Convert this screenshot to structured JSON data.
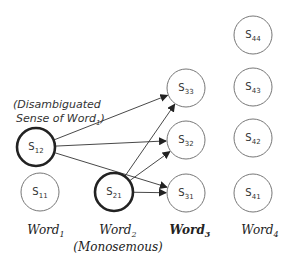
{
  "diagram": {
    "annotation": {
      "line1": "(Disambiguated",
      "line2_prefix": "Sense of Word",
      "line2_sub": "1",
      "line2_suffix": ")"
    },
    "nodes": [
      {
        "id": "S12",
        "base": "S",
        "sub": "12",
        "cx": 36,
        "cy": 147,
        "bold": true
      },
      {
        "id": "S11",
        "base": "S",
        "sub": "11",
        "cx": 40,
        "cy": 192,
        "bold": false
      },
      {
        "id": "S21",
        "base": "S",
        "sub": "21",
        "cx": 114,
        "cy": 192,
        "bold": true
      },
      {
        "id": "S33",
        "base": "S",
        "sub": "33",
        "cx": 186,
        "cy": 88,
        "bold": false
      },
      {
        "id": "S32",
        "base": "S",
        "sub": "32",
        "cx": 186,
        "cy": 140,
        "bold": false
      },
      {
        "id": "S31",
        "base": "S",
        "sub": "31",
        "cx": 186,
        "cy": 193,
        "bold": false
      },
      {
        "id": "S44",
        "base": "S",
        "sub": "44",
        "cx": 253,
        "cy": 35,
        "bold": false
      },
      {
        "id": "S43",
        "base": "S",
        "sub": "43",
        "cx": 253,
        "cy": 87,
        "bold": false
      },
      {
        "id": "S42",
        "base": "S",
        "sub": "42",
        "cx": 253,
        "cy": 138,
        "bold": false
      },
      {
        "id": "S41",
        "base": "S",
        "sub": "41",
        "cx": 253,
        "cy": 193,
        "bold": false
      }
    ],
    "edges": [
      {
        "from": "S12",
        "to": "S33"
      },
      {
        "from": "S12",
        "to": "S32"
      },
      {
        "from": "S12",
        "to": "S31"
      },
      {
        "from": "S21",
        "to": "S33"
      },
      {
        "from": "S21",
        "to": "S32"
      },
      {
        "from": "S21",
        "to": "S31"
      }
    ],
    "words": [
      {
        "base": "Word",
        "sub": "1",
        "x": 46,
        "bold": false,
        "note": ""
      },
      {
        "base": "Word",
        "sub": "2",
        "x": 118,
        "bold": false,
        "note": "(Monosemous)"
      },
      {
        "base": "Word",
        "sub": "3",
        "x": 190,
        "bold": true,
        "note": ""
      },
      {
        "base": "Word",
        "sub": "4",
        "x": 260,
        "bold": false,
        "note": ""
      }
    ],
    "colors": {
      "stroke": "#222222",
      "thin_stroke": "#777777",
      "arrow": "#333333"
    }
  }
}
